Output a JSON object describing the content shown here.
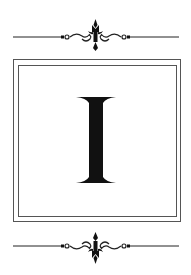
{
  "letter": "I",
  "colors": {
    "ink": "#111111",
    "frame": "#555555",
    "background": "#ffffff"
  },
  "ornaments": {
    "top": "scroll-flourish",
    "bottom": "scroll-flourish"
  }
}
